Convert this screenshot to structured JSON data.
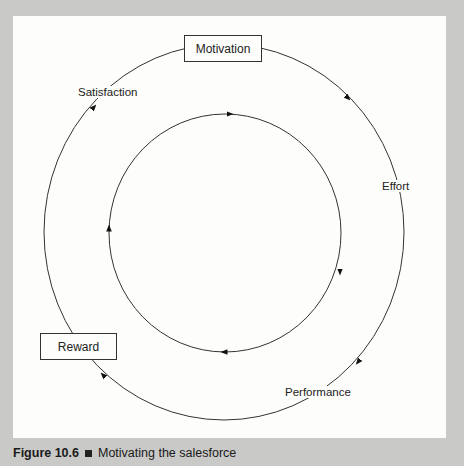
{
  "figure": {
    "number": "Figure 10.6",
    "title": "Motivating the salesforce"
  },
  "diagram": {
    "type": "cycle",
    "outer_cycle": {
      "direction": "clockwise",
      "stages": [
        {
          "id": "motivation",
          "label": "Motivation",
          "boxed": true
        },
        {
          "id": "effort",
          "label": "Effort",
          "boxed": false
        },
        {
          "id": "performance",
          "label": "Performance",
          "boxed": false
        },
        {
          "id": "reward",
          "label": "Reward",
          "boxed": true
        },
        {
          "id": "satisfaction",
          "label": "Satisfaction",
          "boxed": false
        }
      ]
    },
    "inner_cycle": {
      "direction": "clockwise",
      "arrow_count": 4
    }
  },
  "colors": {
    "frame": "#c9c9c7",
    "panel": "#fdfdfb",
    "line": "#333333"
  }
}
